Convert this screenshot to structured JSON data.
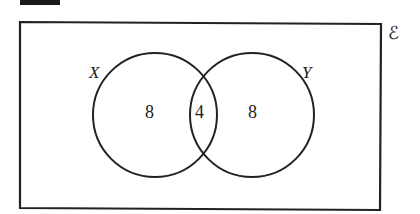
{
  "diagram": {
    "type": "venn",
    "universal_set_label": "ℰ",
    "sets": [
      {
        "name": "X",
        "label": "X",
        "only_count": "8"
      },
      {
        "name": "Y",
        "label": "Y",
        "only_count": "8"
      }
    ],
    "intersection_count": "4",
    "colors": {
      "stroke": "#222222",
      "background": "#ffffff"
    }
  }
}
